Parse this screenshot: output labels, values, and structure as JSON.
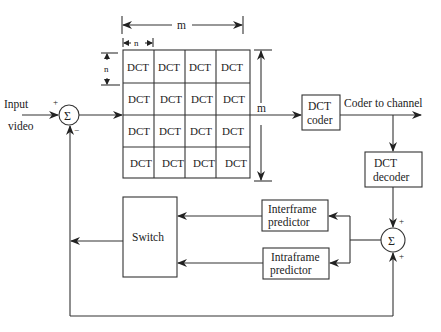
{
  "diagram": {
    "input_label_line1": "Input",
    "input_label_line2": "video",
    "summer1": {
      "symbol": "Σ",
      "plus": "+",
      "minus": "−"
    },
    "grid": {
      "cell_label": "DCT",
      "rows": [
        [
          "DCT",
          "DCT",
          "DCT",
          "DCT"
        ],
        [
          "DCT",
          "DCT",
          "DCT",
          "DCT"
        ],
        [
          "DCT",
          "DCT",
          "DCT",
          "DCT"
        ],
        [
          "DCT",
          "DCT",
          "DCT",
          "DCT"
        ]
      ],
      "dim_width_label": "m",
      "dim_height_label": "m",
      "dim_cell_width_label": "n",
      "dim_cell_height_label": "n"
    },
    "dct_coder": {
      "line1": "DCT",
      "line2": "coder"
    },
    "output_label": "Coder to channel",
    "dct_decoder": {
      "line1": "DCT",
      "line2": "decoder"
    },
    "summer2": {
      "symbol": "Σ",
      "plus_top": "+",
      "plus_bottom": "+"
    },
    "interframe_predictor": {
      "line1": "Interframe",
      "line2": "predictor"
    },
    "intraframe_predictor": {
      "line1": "Intraframe",
      "line2": "predictor"
    },
    "switch": {
      "label": "Switch"
    }
  }
}
